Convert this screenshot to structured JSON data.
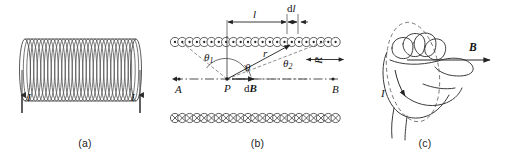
{
  "figure": {
    "panels": [
      {
        "id": "a",
        "caption": "(a)",
        "description": "Solenoid coil with current leads",
        "labels": {
          "current_left": "I",
          "current_right": "I"
        }
      },
      {
        "id": "b",
        "caption": "(b)",
        "description": "Axial cross-section of solenoid showing field point geometry",
        "labels": {
          "length_l": "l",
          "element_dl": "dl",
          "angle_1": "θ",
          "angle_1_sub": "1",
          "angle_mid": "θ",
          "angle_2": "θ",
          "angle_2_sub": "2",
          "radius_r": "r",
          "radius_R": "R",
          "point_P": "P",
          "field_dB": "dB",
          "axis_left": "A",
          "axis_right": "B"
        }
      },
      {
        "id": "c",
        "caption": "(c)",
        "description": "Right-hand rule: fingers curl with current, thumb points along B",
        "labels": {
          "field_B": "B",
          "current_I": "I"
        }
      }
    ]
  },
  "colors": {
    "background": "#ffffff",
    "ink": "#1a1a1a",
    "coil_stroke": "#4a4a4a",
    "light_stroke": "#6e6e6e",
    "axis": "#3a3a3a"
  }
}
